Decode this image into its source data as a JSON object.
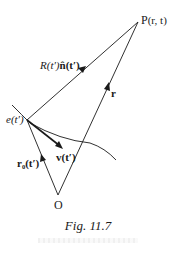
{
  "figure": {
    "caption": "Fig. 11.7",
    "stroke_color": "#1a1a1a",
    "points": {
      "P": {
        "x": 138,
        "y": 22,
        "label": "P (r, t)"
      },
      "e": {
        "x": 27,
        "y": 120,
        "label": "e(t′)"
      },
      "O": {
        "x": 58,
        "y": 195,
        "label": "O"
      }
    },
    "vectors": [
      {
        "name": "R-n-hat",
        "from": "e",
        "to": "P",
        "label": "R(t′) n̂(t′)"
      },
      {
        "name": "r",
        "from": "O",
        "to": "P",
        "label": "r"
      },
      {
        "name": "r0",
        "from": "O",
        "to": "e",
        "label": "r₀(t′)"
      },
      {
        "name": "v",
        "from": "e",
        "to": "v_tip",
        "label": "v(t′)"
      }
    ],
    "curve": {
      "name": "particle-trajectory",
      "start": [
        12,
        105
      ],
      "end": [
        116,
        160
      ]
    },
    "labels": {
      "P": "P",
      "P_args": "(r, t)",
      "R": "R(t′)",
      "n_hat": "n̂(t′)",
      "r": "r",
      "e": "e(t′)",
      "v": "v(t′)",
      "r0": "r₀(t′)",
      "O": "O"
    }
  }
}
